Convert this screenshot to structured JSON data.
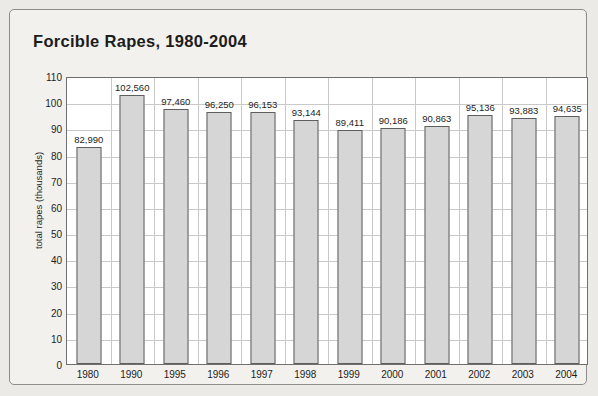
{
  "figure": {
    "title": "Forcible Rapes, 1980-2004",
    "background_color": "#eceae7",
    "plot_background_color": "#ffffff",
    "bar_fill_color": "#d6d6d6",
    "bar_border_color": "#5e5e5e",
    "gridline_color": "#c9c9c9",
    "axis_color": "#6f6f6f",
    "text_color": "#1d1d1d"
  },
  "chart_data": {
    "type": "bar",
    "title": "Forcible Rapes, 1980-2004",
    "xlabel": "",
    "ylabel": "total rapes (thousands)",
    "ylim": [
      0,
      110
    ],
    "ytick_step": 10,
    "grid": true,
    "legend": "none",
    "value_unit": "count",
    "categories": [
      "1980",
      "1990",
      "1995",
      "1996",
      "1997",
      "1998",
      "1999",
      "2000",
      "2001",
      "2002",
      "2003",
      "2004"
    ],
    "values": [
      82990,
      102560,
      96250,
      96250,
      96153,
      93144,
      89411,
      90186,
      90863,
      95136,
      93883,
      94635
    ],
    "value_labels": [
      "82,990",
      "102,560",
      "97,460",
      "96,250",
      "96,153",
      "93,144",
      "89,411",
      "90,186",
      "90,863",
      "95,136",
      "93,883",
      "94,635"
    ],
    "values_exact": [
      82990,
      102560,
      97460,
      96250,
      96153,
      93144,
      89411,
      90186,
      90863,
      95136,
      93883,
      94635
    ],
    "ytick_labels": [
      "0",
      "10",
      "20",
      "30",
      "40",
      "50",
      "60",
      "70",
      "80",
      "90",
      "100",
      "110"
    ]
  }
}
